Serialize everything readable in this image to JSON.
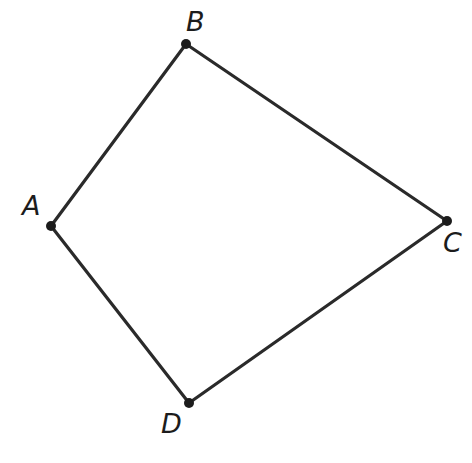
{
  "figure": {
    "kind": "geometry-diagram",
    "shape_name": "quadrilateral",
    "canvas": {
      "width": 472,
      "height": 463
    },
    "background_color": "#ffffff",
    "line_color": "#2a2a2a",
    "line_width": 3.2,
    "vertex_color": "#1c1c1c",
    "vertex_radius": 5,
    "label_color": "#1c1c1c",
    "label_font_size": 27,
    "label_style": "italic",
    "vertices": [
      {
        "id": "A",
        "label": "A",
        "x": 51,
        "y": 226,
        "label_x": 22,
        "label_y": 192,
        "label_position": "left"
      },
      {
        "id": "B",
        "label": "B",
        "x": 186,
        "y": 44,
        "label_x": 186,
        "label_y": 8,
        "label_position": "above"
      },
      {
        "id": "C",
        "label": "C",
        "x": 447,
        "y": 221,
        "label_x": 443,
        "label_y": 229,
        "label_position": "below-right"
      },
      {
        "id": "D",
        "label": "D",
        "x": 189,
        "y": 403,
        "label_x": 161,
        "label_y": 410,
        "label_position": "below-left"
      }
    ],
    "edges": [
      {
        "id": "AB",
        "from": "A",
        "to": "B"
      },
      {
        "id": "BC",
        "from": "B",
        "to": "C"
      },
      {
        "id": "CD",
        "from": "C",
        "to": "D"
      },
      {
        "id": "DA",
        "from": "D",
        "to": "A"
      }
    ]
  }
}
